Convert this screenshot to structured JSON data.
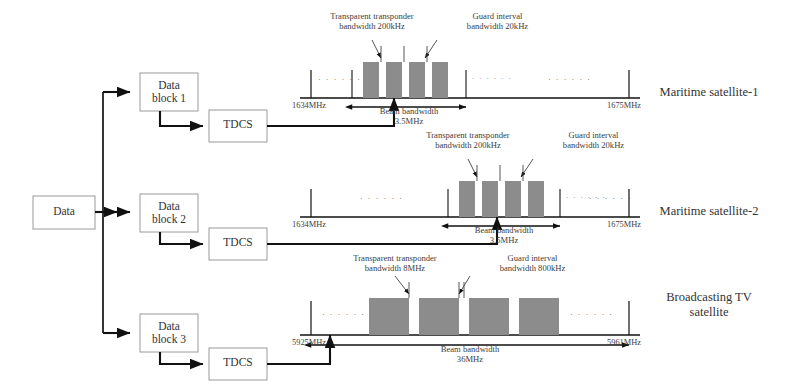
{
  "flow": {
    "source": {
      "label": "Data"
    },
    "blocks": [
      {
        "label": "Data\nblock 1"
      },
      {
        "label": "Data\nblock 2"
      },
      {
        "label": "Data\nblock 3"
      }
    ],
    "processors": [
      {
        "label": "TDCS"
      },
      {
        "label": "TDCS"
      },
      {
        "label": "TDCS"
      }
    ]
  },
  "spectra": [
    {
      "satellite": "Maritime satellite-1",
      "freq_start": "1634MHz",
      "freq_end": "1675MHz",
      "beam_label": "Beam bandwidth",
      "beam_value": "3.5MHz",
      "transponder_callout": "Transparent transponder\nbandwidth 200kHz",
      "guard_callout": "Guard interval\nbandwidth 20kHz",
      "ellipsis": "· · · · · ·"
    },
    {
      "satellite": "Maritime satellite-2",
      "freq_start": "1634MHz",
      "freq_end": "1675MHz",
      "beam_label": "Beam bandwidth",
      "beam_value": "3.5MHz",
      "transponder_callout": "Transparent transponder\nbandwidth 200kHz",
      "guard_callout": "Guard interval\nbandwidth 20kHz",
      "ellipsis": "· · · · · ·"
    },
    {
      "satellite": "Broadcasting TV\nsatellite",
      "freq_start": "5925MHz",
      "freq_end": "5961MHz",
      "beam_label": "Beam bandwidth",
      "beam_value": "36MHz",
      "transponder_callout": "Transparent transponder\nbandwidth 8MHz",
      "guard_callout": "Guard interval\nbandwidth 800kHz",
      "ellipsis": "· · · · · ·"
    }
  ],
  "colors": {
    "bar_fill": "#8c8c8c",
    "line": "#1a1a1a",
    "box_border": "#9a9a9a",
    "text": "#333333"
  }
}
